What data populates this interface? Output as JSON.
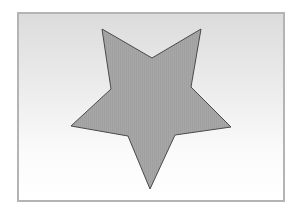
{
  "figure": {
    "frame": {
      "left": 17,
      "top": 12,
      "right": 285,
      "bottom": 202,
      "border_color": "#b4b4b4",
      "gradient_top": "#dcdcdc",
      "gradient_bottom": "#ffffff"
    },
    "shape": {
      "type": "five-pointed-star",
      "orientation": "inverted",
      "fill_color": "#a5a5a5",
      "stroke_color": "#4a4a4a",
      "points": [
        [
          102,
          29
        ],
        [
          152,
          58
        ],
        [
          201,
          29
        ],
        [
          191,
          87
        ],
        [
          231,
          127
        ],
        [
          175,
          135
        ],
        [
          150,
          189
        ],
        [
          128,
          136
        ],
        [
          71,
          126
        ],
        [
          111,
          89
        ]
      ]
    }
  }
}
